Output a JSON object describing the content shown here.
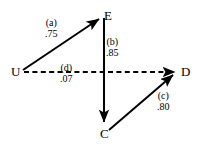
{
  "diagram": {
    "type": "path-diagram",
    "background_color": "#ffffff",
    "stroke_color": "#000000",
    "nodes": [
      {
        "id": "E",
        "label": "E",
        "x": 104,
        "y": 9
      },
      {
        "id": "U",
        "label": "U",
        "x": 11,
        "y": 65
      },
      {
        "id": "D",
        "label": "D",
        "x": 181,
        "y": 65
      },
      {
        "id": "C",
        "label": "C",
        "x": 100,
        "y": 127
      }
    ],
    "edges": [
      {
        "id": "a",
        "from": "U",
        "to": "E",
        "style": "solid",
        "arrow": "to",
        "label_name": "(a)",
        "label_value": ".75",
        "label_x": 45,
        "label_y": 17
      },
      {
        "id": "b",
        "from": "E",
        "to": "C",
        "style": "solid",
        "arrow": "to",
        "label_name": "(b)",
        "label_value": ".85",
        "label_x": 106,
        "label_y": 36
      },
      {
        "id": "c",
        "from": "C",
        "to": "D",
        "style": "solid",
        "arrow": "to",
        "label_name": "(c)",
        "label_value": ".80",
        "label_x": 157,
        "label_y": 90
      },
      {
        "id": "d",
        "from": "U",
        "to": "D",
        "style": "dashed",
        "arrow": "to",
        "label_name": "(d)",
        "label_value": ".07",
        "label_x": 60,
        "label_y": 62
      }
    ]
  }
}
